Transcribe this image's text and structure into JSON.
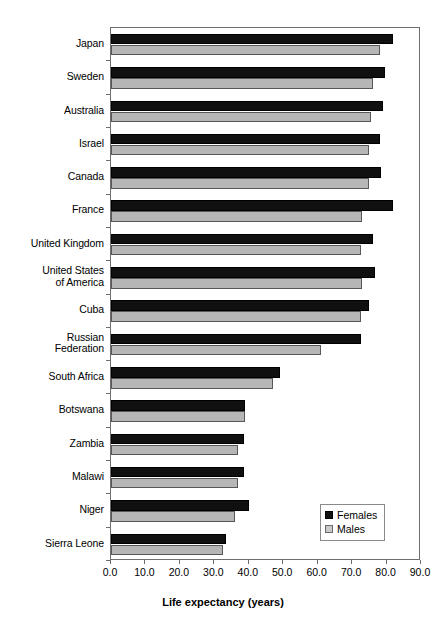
{
  "chart_data": {
    "type": "bar",
    "orientation": "horizontal",
    "title": "",
    "xlabel": "Life expectancy (years)",
    "ylabel": "",
    "xlim": [
      0.0,
      90.0
    ],
    "xticks": [
      "0.0",
      "10.0",
      "20.0",
      "30.0",
      "40.0",
      "50.0",
      "60.0",
      "70.0",
      "80.0",
      "90.0"
    ],
    "grid": false,
    "legend_position": "bottom-right",
    "categories": [
      "Japan",
      "Sweden",
      "Australia",
      "Israel",
      "Canada",
      "France",
      "United Kingdom",
      "United States\nof America",
      "Cuba",
      "Russian\nFederation",
      "South Africa",
      "Botswana",
      "Zambia",
      "Malawi",
      "Niger",
      "Sierra Leone"
    ],
    "series": [
      {
        "name": "Females",
        "color": "#101010",
        "values": [
          82.0,
          79.5,
          79.0,
          78.0,
          78.5,
          82.0,
          76.0,
          76.5,
          75.0,
          72.5,
          49.0,
          39.0,
          38.5,
          38.5,
          40.0,
          33.5
        ]
      },
      {
        "name": "Males",
        "color": "#b6b6b6",
        "values": [
          78.0,
          76.0,
          75.5,
          75.0,
          75.0,
          73.0,
          72.5,
          73.0,
          72.5,
          61.0,
          47.0,
          39.0,
          37.0,
          37.0,
          36.0,
          32.5
        ]
      }
    ]
  },
  "legend": {
    "items": [
      {
        "label": "Females",
        "swatch": "female"
      },
      {
        "label": "Males",
        "swatch": "male"
      }
    ]
  }
}
